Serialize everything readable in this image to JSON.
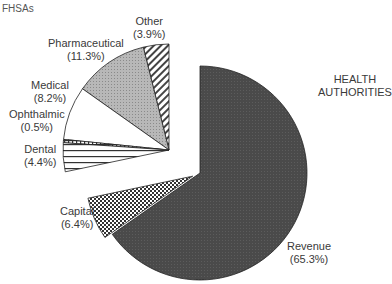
{
  "chart_data": {
    "type": "pie",
    "title": "",
    "groups": [
      {
        "name": "FHSAs",
        "slices": [
          {
            "label": "Other",
            "value": 3.9,
            "pattern": "diagonal-hatch"
          },
          {
            "label": "Pharmaceutical",
            "value": 11.3,
            "pattern": "light-gray-dots"
          },
          {
            "label": "Medical",
            "value": 8.2,
            "pattern": "white"
          },
          {
            "label": "Ophthalmic",
            "value": 0.5,
            "pattern": "grid"
          },
          {
            "label": "Dental",
            "value": 4.4,
            "pattern": "horizontal-lines"
          }
        ]
      },
      {
        "name": "HEALTH AUTHORITIES",
        "slices": [
          {
            "label": "Revenue",
            "value": 65.3,
            "pattern": "dark-gray"
          },
          {
            "label": "Capital",
            "value": 6.4,
            "pattern": "checkerboard"
          }
        ]
      }
    ],
    "unit": "%"
  },
  "labels": {
    "fhsas": "FHSAs",
    "ha_line1": "HEALTH",
    "ha_line2": "AUTHORITIES",
    "other": "Other",
    "other_pct": "(3.9%)",
    "pharma": "Pharmaceutical",
    "pharma_pct": "(11.3%)",
    "medical": "Medical",
    "medical_pct": "(8.2%)",
    "ophthalmic": "Ophthalmic",
    "ophthalmic_pct": "(0.5%)",
    "dental": "Dental",
    "dental_pct": "(4.4%)",
    "capital": "Capital",
    "capital_pct": "(6.4%)",
    "revenue": "Revenue",
    "revenue_pct": "(65.3%)"
  }
}
